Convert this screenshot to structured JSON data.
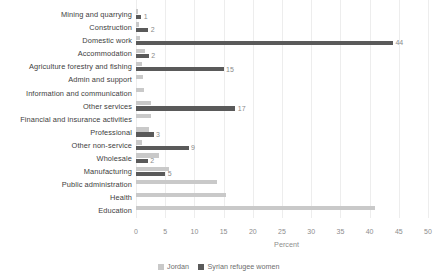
{
  "chart_data": {
    "type": "bar",
    "orientation": "horizontal",
    "title": "",
    "xlabel": "Percent",
    "ylabel": "",
    "xlim": [
      0,
      50
    ],
    "xticks": [
      "0",
      "5",
      "10",
      "15",
      "20",
      "25",
      "30",
      "35",
      "40",
      "45",
      "50"
    ],
    "grid": true,
    "legend_position": "bottom",
    "categories": [
      "Mining and quarrying",
      "Construction",
      "Domestic work",
      "Accommodation",
      "Agriculture forestry and fishing",
      "Admin and support",
      "Information and communication",
      "Other services",
      "Financial and insurance activities",
      "Professional",
      "Other non-service",
      "Wholesale",
      "Manufacturing",
      "Public administration",
      "Health",
      "Education"
    ],
    "series": [
      {
        "name": "Jordan",
        "color": "#c9c9c9",
        "values": [
          0.3,
          0.5,
          0.6,
          1.6,
          1.0,
          1.2,
          1.4,
          2.6,
          2.6,
          2.3,
          1.0,
          4.0,
          5.6,
          13.8,
          15.4,
          41.0
        ],
        "labels": [
          "",
          "",
          "",
          "",
          "",
          "",
          "",
          "",
          "",
          "",
          "",
          "",
          "",
          "",
          "",
          ""
        ]
      },
      {
        "name": "Syrian refugee women",
        "color": "#5a5a5a",
        "values": [
          0.9,
          2.1,
          44.0,
          2.2,
          15.0,
          0.0,
          0.0,
          17.0,
          0.0,
          3.0,
          9.0,
          2.0,
          5.0,
          0.0,
          0.0,
          0.0
        ],
        "labels": [
          "1",
          "2",
          "44",
          "2",
          "15",
          "",
          "",
          "17",
          "",
          "3",
          "9",
          "2",
          "5",
          "",
          "",
          ""
        ]
      }
    ]
  },
  "legend": {
    "items": [
      {
        "label": "Jordan",
        "color": "#c9c9c9"
      },
      {
        "label": "Syrian refugee women",
        "color": "#5a5a5a"
      }
    ]
  }
}
